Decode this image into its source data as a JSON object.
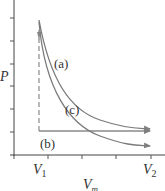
{
  "diagram": {
    "type": "pv-diagram",
    "axes": {
      "y_label": "P",
      "x_label": "V",
      "x_label_sub": "m",
      "x_ticks": [
        {
          "label": "V",
          "sub": "1"
        },
        {
          "label": "V",
          "sub": "2"
        }
      ],
      "axis_color": "#444444"
    },
    "paths": [
      {
        "id": "a",
        "label": "(a)",
        "description": "upper curve from V1 high P to V2",
        "color": "#7a7a7a"
      },
      {
        "id": "b",
        "label": "(b)",
        "description": "dashed vertical drop at V1 then horizontal to V2",
        "color": "#8a8a8a"
      },
      {
        "id": "c",
        "label": "(c)",
        "description": "lower steeper curve from V1 high P to V2",
        "color": "#7a7a7a"
      }
    ]
  }
}
